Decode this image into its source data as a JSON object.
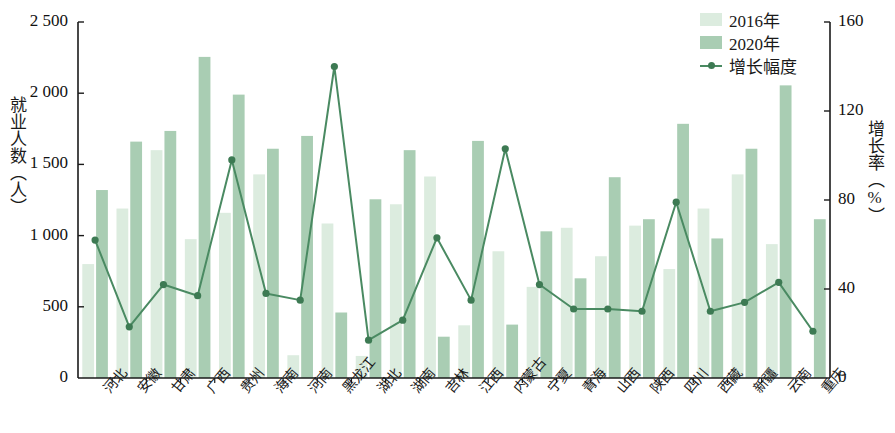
{
  "chart_data": {
    "type": "bar",
    "title": "",
    "subtitle": "",
    "xlabel": "",
    "ylabel": "就业人数（人）",
    "y2label": "增长率（%）",
    "ylim": [
      0,
      2500
    ],
    "y2lim": [
      0,
      160
    ],
    "yticks": [
      "0",
      "500",
      "1 000",
      "1 500",
      "2 000",
      "2 500"
    ],
    "ytick_values": [
      0,
      500,
      1000,
      1500,
      2000,
      2500
    ],
    "y2ticks": [
      "0",
      "40",
      "80",
      "120",
      "160"
    ],
    "y2tick_values": [
      0,
      40,
      80,
      120,
      160
    ],
    "grid": false,
    "legend_position": "top-right",
    "categories": [
      "河北",
      "安徽",
      "甘肃",
      "广西",
      "贵州",
      "海南",
      "河南",
      "黑龙江",
      "湖北",
      "湖南",
      "吉林",
      "江西",
      "内蒙古",
      "宁夏",
      "青海",
      "山西",
      "陕西",
      "四川",
      "西藏",
      "新疆",
      "云南",
      "重庆"
    ],
    "series": [
      {
        "name": "2016年",
        "type": "bar",
        "axis": "left",
        "color": "#dcecdf",
        "values": [
          800,
          1190,
          1600,
          975,
          1160,
          1430,
          160,
          1085,
          155,
          1220,
          1415,
          370,
          890,
          640,
          1055,
          855,
          1070,
          765,
          1190,
          1430,
          940,
          0
        ]
      },
      {
        "name": "2020年",
        "type": "bar",
        "axis": "left",
        "color": "#a9cdb3",
        "values": [
          1320,
          1660,
          1735,
          2255,
          1990,
          1610,
          1700,
          460,
          1255,
          1600,
          290,
          1665,
          375,
          1030,
          700,
          1410,
          1115,
          1785,
          980,
          1610,
          2055,
          1115
        ]
      },
      {
        "name": "增长幅度",
        "type": "line",
        "axis": "right",
        "color": "#4a8a62",
        "values": [
          62,
          23,
          42,
          37,
          98,
          38,
          35,
          140,
          17,
          26,
          63,
          35,
          103,
          42,
          31,
          31,
          30,
          79,
          30,
          34,
          43,
          21
        ]
      }
    ],
    "legend": [
      {
        "label": "2016年",
        "marker": "swatch",
        "color": "#dcecdf"
      },
      {
        "label": "2020年",
        "marker": "swatch",
        "color": "#a9cdb3"
      },
      {
        "label": "增长幅度",
        "marker": "line",
        "color": "#4a8a62"
      }
    ]
  },
  "axes": {
    "left_title": "就业人数（人）",
    "right_title": "增长率（%）"
  }
}
